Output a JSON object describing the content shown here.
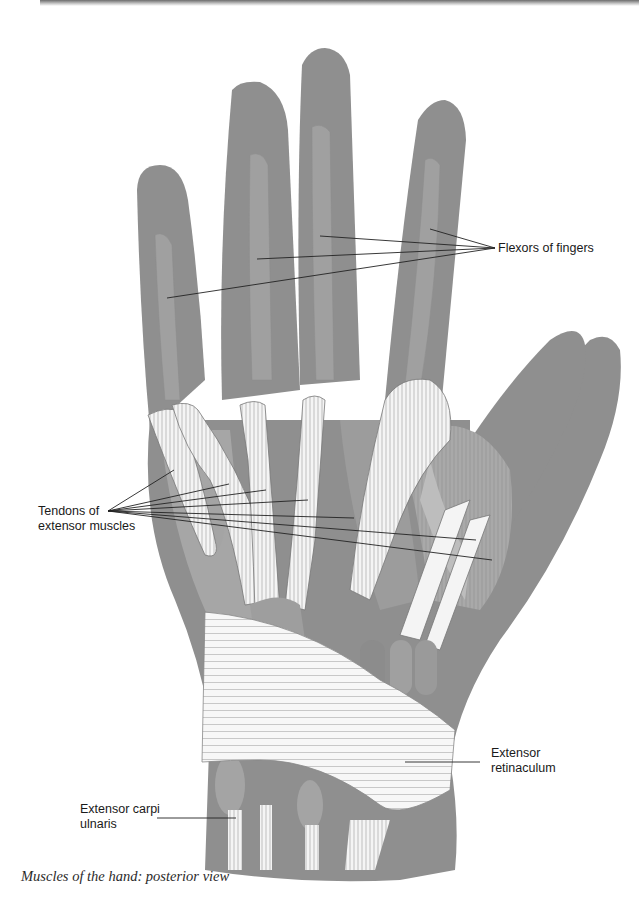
{
  "figure": {
    "caption": "Muscles of the hand: posterior view",
    "colors": {
      "skin": "#8f8f8f",
      "skin_light": "#a3a3a3",
      "muscle": "#b5b5b5",
      "muscle_dark": "#8a8a8a",
      "tendon": "#f4f4f4",
      "tendon_stroke": "#7a7a7a",
      "leader_line": "#222222"
    },
    "labels": {
      "flexors": {
        "line1": "Flexors of fingers"
      },
      "tendons": {
        "line1": "Tendons of",
        "line2": "extensor muscles"
      },
      "retinaculum": {
        "line1": "Extensor",
        "line2": "retinaculum"
      },
      "carpi_ulnaris": {
        "line1": "Extensor carpi",
        "line2": "ulnaris"
      }
    }
  }
}
